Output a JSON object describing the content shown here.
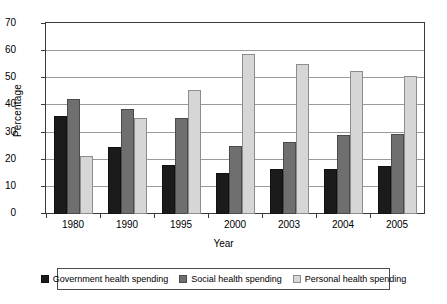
{
  "chart_data": {
    "type": "bar",
    "title": "",
    "xlabel": "Year",
    "ylabel": "Percentage",
    "categories": [
      "1980",
      "1990",
      "1995",
      "2000",
      "2003",
      "2004",
      "2005"
    ],
    "series": [
      {
        "name": "Government health spending",
        "color": "#1b1b1b",
        "values": [
          36.2,
          24.8,
          18.0,
          15.0,
          16.6,
          16.5,
          17.6
        ]
      },
      {
        "name": "Social health spending",
        "color": "#6f6f6f",
        "values": [
          42.2,
          38.8,
          35.3,
          25.1,
          26.7,
          29.0,
          29.4
        ]
      },
      {
        "name": "Personal health spending",
        "color": "#d6d6d6",
        "values": [
          21.5,
          35.3,
          45.7,
          59.0,
          55.4,
          52.8,
          51.0
        ]
      }
    ],
    "ylim": [
      0,
      70
    ],
    "yticks": [
      0,
      10,
      20,
      30,
      40,
      50,
      60,
      70
    ],
    "grid": true,
    "legend_position": "bottom"
  }
}
